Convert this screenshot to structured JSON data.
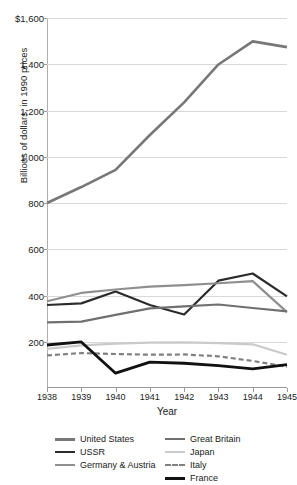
{
  "chart_data": {
    "type": "line",
    "title": "",
    "xlabel": "Year",
    "ylabel": "Billions of dollars, in 1990 prices",
    "x": [
      1938,
      1939,
      1940,
      1941,
      1942,
      1943,
      1944,
      1945
    ],
    "xtick_labels": [
      "1938",
      "1939",
      "1940",
      "1941",
      "1942",
      "1943",
      "1944",
      "1945"
    ],
    "ytick_labels": [
      "$1,600",
      "1,400",
      "1,200",
      "1,000",
      "800",
      "600",
      "400",
      "200"
    ],
    "ytick_values": [
      1600,
      1400,
      1200,
      1000,
      800,
      600,
      400,
      200
    ],
    "ylim": [
      0,
      1600
    ],
    "xlim": [
      1938,
      1945
    ],
    "grid": true,
    "legend_position": "bottom",
    "series": [
      {
        "name": "United States",
        "color": "#777777",
        "width": 2.6,
        "dash": "none",
        "values": [
          800,
          869,
          943,
          1094,
          1235,
          1399,
          1499,
          1474
        ]
      },
      {
        "name": "USSR",
        "color": "#2b2b2b",
        "width": 2.2,
        "dash": "none",
        "values": [
          359,
          366,
          417,
          359,
          318,
          464,
          495,
          396
        ]
      },
      {
        "name": "Germany & Austria",
        "color": "#8f8f8f",
        "width": 2.2,
        "dash": "none",
        "values": [
          375,
          411,
          426,
          438,
          445,
          453,
          462,
          328
        ]
      },
      {
        "name": "Great Britain",
        "color": "#707070",
        "width": 2.2,
        "dash": "none",
        "values": [
          284,
          287,
          316,
          344,
          353,
          361,
          346,
          331
        ]
      },
      {
        "name": "Japan",
        "color": "#cacaca",
        "width": 2.2,
        "dash": "none",
        "values": [
          169,
          184,
          192,
          196,
          197,
          194,
          189,
          144
        ]
      },
      {
        "name": "Italy",
        "color": "#808080",
        "width": 2.2,
        "dash": "dashed",
        "values": [
          141,
          151,
          147,
          144,
          145,
          137,
          117,
          92
        ]
      },
      {
        "name": "France",
        "color": "#111111",
        "width": 2.8,
        "dash": "none",
        "values": [
          186,
          199,
          64,
          112,
          107,
          97,
          83,
          101
        ]
      }
    ]
  }
}
